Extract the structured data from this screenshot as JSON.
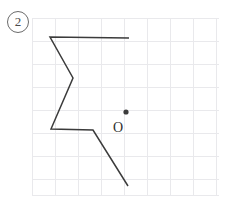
{
  "figure": {
    "label": "2",
    "label_icon": "circled-number-icon",
    "origin_letter": "O",
    "point_marker_icon": "filled-dot-icon",
    "background_color": "#ffffff",
    "grid_color": "#e9e9ec",
    "stroke_color": "#3b3b3b",
    "label_color": "#6b6b6b"
  },
  "chart_data": {
    "type": "line",
    "title": "",
    "xlabel": "",
    "ylabel": "",
    "grid": true,
    "legend": null,
    "grid_spec": {
      "left": 32,
      "top": 18,
      "right": 219,
      "bottom": 195,
      "cell_size": 23,
      "cols": 8,
      "rows": 7.7
    },
    "xlim": [
      32,
      219
    ],
    "ylim": [
      18,
      195
    ],
    "annotations": [
      {
        "name": "origin-label",
        "text": "O",
        "x": 113,
        "y": 121
      },
      {
        "name": "point-dot",
        "text": "",
        "x": 126,
        "y": 112,
        "r": 2.6
      },
      {
        "name": "figure-number",
        "text": "2",
        "x": 18,
        "y": 22
      }
    ],
    "series": [
      {
        "name": "polyline",
        "closed": false,
        "points": [
          [
            129,
            38
          ],
          [
            50,
            37
          ],
          [
            73,
            78
          ],
          [
            51,
            129
          ],
          [
            93,
            130
          ],
          [
            128,
            186
          ]
        ]
      }
    ]
  }
}
